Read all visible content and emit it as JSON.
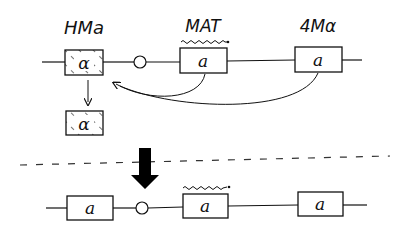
{
  "diagram": {
    "type": "mating-type switching schematic",
    "top_row": {
      "labels": {
        "left": "HMa",
        "middle": "MAT",
        "right": "4Mα"
      },
      "boxes": [
        {
          "id": "hm-left",
          "text": "α",
          "style": "hatched"
        },
        {
          "id": "mat",
          "text": "a",
          "style": "plain",
          "transcribed": true
        },
        {
          "id": "hm-right",
          "text": "a",
          "style": "plain"
        }
      ],
      "copy_box": {
        "text": "α",
        "style": "hatched"
      }
    },
    "bottom_row": {
      "boxes": [
        {
          "id": "hm-left",
          "text": "a"
        },
        {
          "id": "mat",
          "text": "a",
          "transcribed": true
        },
        {
          "id": "hm-right",
          "text": "a"
        }
      ]
    },
    "colors": {
      "ink": "#111111",
      "background": "#ffffff",
      "dash": "#333333"
    }
  }
}
